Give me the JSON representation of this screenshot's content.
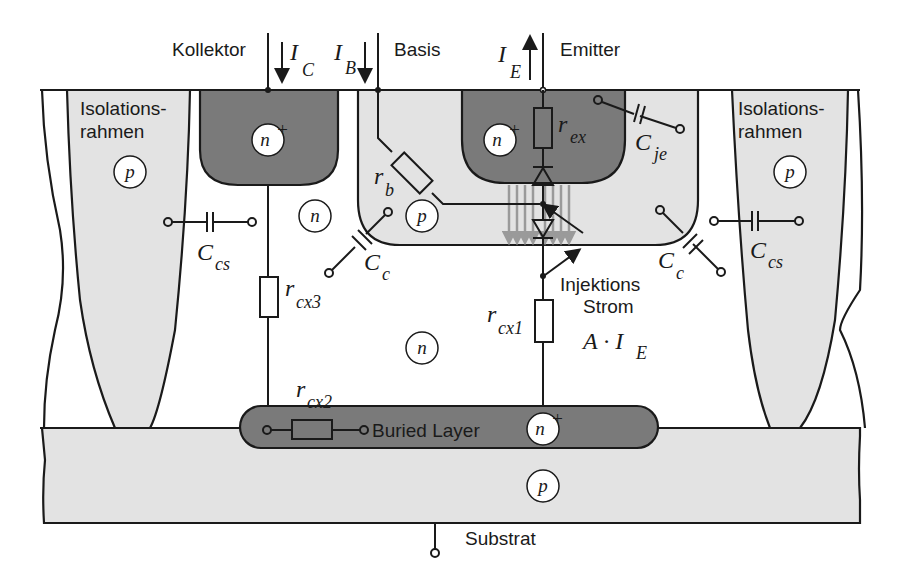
{
  "diagram": {
    "type": "bipolar-transistor-cross-section",
    "terminals": {
      "collector": "Kollektor",
      "base": "Basis",
      "emitter": "Emitter",
      "substrate": "Substrat"
    },
    "currents": {
      "ic": {
        "main": "I",
        "sub": "C"
      },
      "ib": {
        "main": "I",
        "sub": "B"
      },
      "ie": {
        "main": "I",
        "sub": "E"
      }
    },
    "regions": {
      "isolation_left_line1": "Isolations-",
      "isolation_left_line2": "rahmen",
      "isolation_right_line1": "Isolations-",
      "isolation_right_line2": "rahmen",
      "buried_layer": "Buried Layer",
      "injection_line1": "Injektions",
      "injection_line2": "Strom"
    },
    "doping": {
      "iso_left": "p",
      "iso_right": "p",
      "collector_contact": "n",
      "collector_contact_sup": "+",
      "emitter": "n",
      "emitter_sup": "+",
      "base": "p",
      "epi_upper": "n",
      "epi_lower": "n",
      "buried": "n",
      "buried_sup": "+",
      "substrate": "p"
    },
    "components": {
      "rb": {
        "main": "r",
        "sub": "b"
      },
      "rex": {
        "main": "r",
        "sub": "ex"
      },
      "rcx1": {
        "main": "r",
        "sub": "cx1"
      },
      "rcx2": {
        "main": "r",
        "sub": "cx2"
      },
      "rcx3": {
        "main": "r",
        "sub": "cx3"
      },
      "cje": {
        "main": "C",
        "sub": "je"
      },
      "cc_left": {
        "main": "C",
        "sub": "c"
      },
      "cc_right": {
        "main": "C",
        "sub": "c"
      },
      "ccs_left": {
        "main": "C",
        "sub": "cs"
      },
      "ccs_right": {
        "main": "C",
        "sub": "cs"
      },
      "injection_source": {
        "prefix": "A · I",
        "sub": "E"
      }
    },
    "colors": {
      "n_plus": "#7a7a7a",
      "p_region": "#e3e3e3",
      "n_region": "#ffffff",
      "line": "#1a1a1a",
      "injection_arrows": "#9a9a9a"
    }
  }
}
